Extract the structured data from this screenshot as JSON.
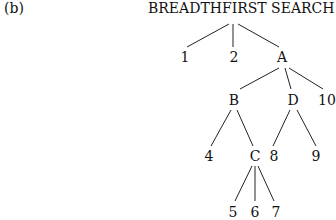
{
  "figure_label": "(b)",
  "title": "BREADTHFIRST SEARCH",
  "tree": {
    "root": "BREADTHFIRST SEARCH",
    "nodes": [
      {
        "id": "n1",
        "label": "1",
        "x": 185,
        "y": 57,
        "parent": "root"
      },
      {
        "id": "n2",
        "label": "2",
        "x": 234,
        "y": 57,
        "parent": "root"
      },
      {
        "id": "nA",
        "label": "A",
        "x": 282,
        "y": 57,
        "parent": "root"
      },
      {
        "id": "nB",
        "label": "B",
        "x": 234,
        "y": 100,
        "parent": "nA"
      },
      {
        "id": "nD",
        "label": "D",
        "x": 293,
        "y": 100,
        "parent": "nA"
      },
      {
        "id": "n10",
        "label": "10",
        "x": 327,
        "y": 100,
        "parent": "nA"
      },
      {
        "id": "n4",
        "label": "4",
        "x": 209,
        "y": 156,
        "parent": "nB"
      },
      {
        "id": "nC",
        "label": "C",
        "x": 255,
        "y": 156,
        "parent": "nB"
      },
      {
        "id": "n8",
        "label": "8",
        "x": 274,
        "y": 156,
        "parent": "nD"
      },
      {
        "id": "n9",
        "label": "9",
        "x": 316,
        "y": 156,
        "parent": "nD"
      },
      {
        "id": "n5",
        "label": "5",
        "x": 233,
        "y": 212,
        "parent": "nC"
      },
      {
        "id": "n6",
        "label": "6",
        "x": 255,
        "y": 212,
        "parent": "nC"
      },
      {
        "id": "n7",
        "label": "7",
        "x": 276,
        "y": 212,
        "parent": "nC"
      }
    ]
  }
}
